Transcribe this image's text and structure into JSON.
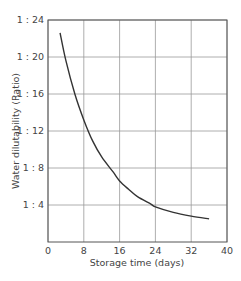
{
  "chart_data": {
    "type": "line",
    "title": "",
    "xlabel": "Storage time  (days)",
    "ylabel": "Water dilutability  (Ratio)",
    "xlim": [
      0,
      40
    ],
    "ylim": [
      0,
      24
    ],
    "grid": true,
    "legend": null,
    "x_ticks": [
      0,
      8,
      16,
      24,
      32,
      40
    ],
    "x_tick_labels": [
      "0",
      "8",
      "16",
      "24",
      "32",
      "40"
    ],
    "y_ticks": [
      4,
      8,
      12,
      16,
      20,
      24
    ],
    "y_tick_labels": [
      "1 : 4",
      "1 : 8",
      "1 : 12",
      "1 : 16",
      "1 : 20",
      "1 : 24"
    ],
    "series": [
      {
        "name": "Water dilutability",
        "color": "#333333",
        "x": [
          2.7,
          4,
          6,
          8,
          10,
          12,
          14.5,
          16,
          18,
          20,
          23,
          24,
          28,
          32,
          36
        ],
        "y": [
          22.6,
          19.6,
          16.0,
          13.2,
          10.9,
          9.2,
          7.6,
          6.6,
          5.7,
          4.9,
          4.1,
          3.8,
          3.2,
          2.8,
          2.5
        ]
      }
    ]
  }
}
